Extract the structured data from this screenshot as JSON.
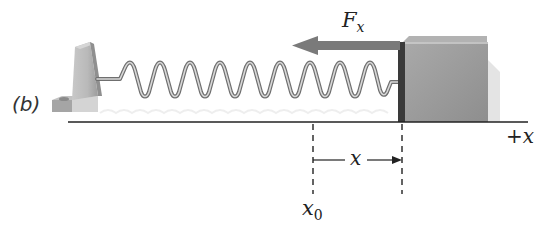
{
  "figure": {
    "panel_label": "(b)",
    "force_label": "F",
    "force_subscript": "x",
    "axis_label": "+x",
    "displacement_label": "x",
    "origin_label": "x",
    "origin_subscript": "0"
  },
  "colors": {
    "arrow": "#7a7a7a",
    "block": "#9a9a9a",
    "anchor": "#b5b5b5",
    "spring": "#8c8c8c",
    "lines": "#222222"
  }
}
